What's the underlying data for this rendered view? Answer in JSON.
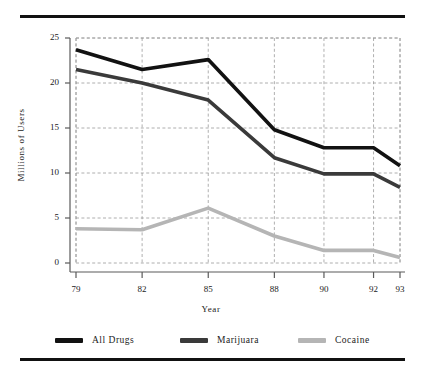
{
  "chart_data": {
    "type": "line",
    "title": "",
    "xlabel": "Year",
    "ylabel": "Millions of Users",
    "categories": [
      "79",
      "82",
      "85",
      "88",
      "90",
      "92",
      "93"
    ],
    "x_positions": [
      0,
      1,
      2,
      3,
      3.75,
      4.5,
      4.9
    ],
    "xlim": [
      0,
      4.9
    ],
    "ylim": [
      0,
      25
    ],
    "y_ticks": [
      0,
      5,
      10,
      15,
      20,
      25
    ],
    "grid": true,
    "legend_position": "bottom",
    "series": [
      {
        "name": "All Drugs",
        "color": "#121212",
        "values": [
          23.7,
          21.5,
          22.6,
          14.8,
          12.8,
          12.8,
          10.8
        ]
      },
      {
        "name": "Marijuara",
        "color": "#3a3a3a",
        "values": [
          21.5,
          20.0,
          18.1,
          11.7,
          9.9,
          9.9,
          8.4
        ]
      },
      {
        "name": "Cocaine",
        "color": "#b5b5b5",
        "values": [
          3.8,
          3.7,
          6.1,
          3.0,
          1.4,
          1.4,
          0.6
        ]
      }
    ]
  },
  "decor": {
    "rule_color": "#111111"
  }
}
